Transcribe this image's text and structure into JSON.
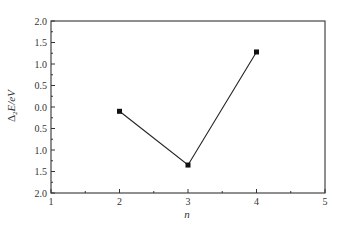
{
  "chart_data": {
    "type": "line",
    "title": "",
    "xlabel": "n",
    "ylabel_parts": {
      "delta": "Δ",
      "sub": "2",
      "rest": "E/eV"
    },
    "ylabel": "Δ2E/eV",
    "xlim": [
      1,
      5
    ],
    "ylim": [
      -2.0,
      2.0
    ],
    "x_ticks": [
      1,
      2,
      3,
      4,
      5
    ],
    "x_tick_labels": [
      "1",
      "2",
      "3",
      "4",
      "5"
    ],
    "y_ticks": [
      2.0,
      1.5,
      1.0,
      0.5,
      0.0,
      -0.5,
      -1.0,
      -1.5,
      -2.0
    ],
    "y_tick_labels": [
      "2.0",
      "1.5",
      "1.0",
      "0.5",
      "0.0",
      "0.5",
      "1.0",
      "1.5",
      "2.0"
    ],
    "grid": false,
    "legend": "none",
    "series": [
      {
        "name": "Δ2E",
        "x": [
          2,
          3,
          4
        ],
        "values": [
          -0.1,
          -1.35,
          1.28
        ],
        "color": "#222222",
        "marker": "square"
      }
    ]
  }
}
